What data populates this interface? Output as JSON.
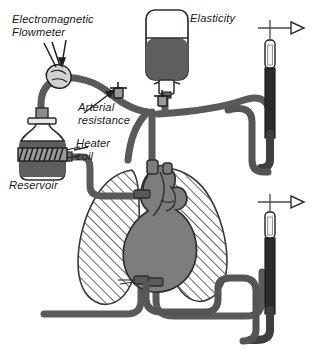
{
  "figure": {
    "background_color": "#ffffff",
    "ink_color": "#1a1a1a",
    "tube_color": "#555555",
    "fluid_color": "#333333",
    "organ_color": "#7d7d7d",
    "lung_hatch_color": "#555555"
  },
  "labels": {
    "flowmeter": "Electromagnetic\nFlowmeter",
    "elasticity": "Elasticity",
    "arterial_resistance": "Arterial\nresistance",
    "heater_coil": "Heater\ncoil",
    "reservoir": "Reservoir"
  },
  "components": [
    {
      "name": "electromagnetic-flowmeter",
      "label": "Electromagnetic Flowmeter",
      "type": "sensor-cuff"
    },
    {
      "name": "elasticity-chamber",
      "label": "Elasticity",
      "type": "compliance-bag"
    },
    {
      "name": "arterial-resistance-valve",
      "label": "Arterial resistance",
      "type": "stopcock"
    },
    {
      "name": "heater-coil",
      "label": "Heater coil",
      "type": "coil"
    },
    {
      "name": "reservoir-bottle",
      "label": "Reservoir",
      "type": "reservoir"
    },
    {
      "name": "heart",
      "label": "Heart",
      "type": "organ"
    },
    {
      "name": "left-lung",
      "label": "Lung",
      "type": "organ-hatched"
    },
    {
      "name": "right-lung",
      "label": "Lung",
      "type": "organ-hatched"
    },
    {
      "name": "arterial-manometer",
      "label": "Arterial pressure manometer",
      "type": "manometer"
    },
    {
      "name": "venous-manometer",
      "label": "Venous pressure manometer",
      "type": "manometer"
    }
  ],
  "manometers": [
    {
      "name": "arterial-manometer",
      "position": "upper-right",
      "arrow_direction": "right"
    },
    {
      "name": "venous-manometer",
      "position": "lower-right",
      "arrow_direction": "right"
    }
  ]
}
